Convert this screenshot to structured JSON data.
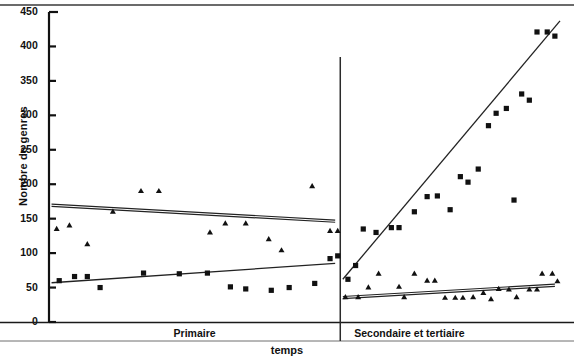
{
  "chart_data": {
    "type": "scatter",
    "title": "",
    "xlabel": "temps",
    "ylabel": "Nombre de genres",
    "ylim": [
      0,
      450
    ],
    "ytick_labels": [
      "0",
      "50",
      "100",
      "150",
      "200",
      "250",
      "300",
      "350",
      "400",
      "450"
    ],
    "ytick_values": [
      0,
      50,
      100,
      150,
      200,
      250,
      300,
      350,
      400,
      450
    ],
    "xlim": [
      0,
      100
    ],
    "grid": false,
    "legend": "none",
    "x_categories": [
      "Primaire",
      "Secondaire et tertiaire"
    ],
    "category_divider_x": 57,
    "marker_color": "#111111",
    "line_color": "#222222",
    "series": [
      {
        "name": "carres",
        "marker": "square",
        "points": [
          {
            "x": 2.0,
            "y": 60
          },
          {
            "x": 5.0,
            "y": 66
          },
          {
            "x": 7.5,
            "y": 66
          },
          {
            "x": 10.0,
            "y": 50
          },
          {
            "x": 18.5,
            "y": 71
          },
          {
            "x": 25.5,
            "y": 70
          },
          {
            "x": 31.0,
            "y": 71
          },
          {
            "x": 35.5,
            "y": 51
          },
          {
            "x": 38.5,
            "y": 48
          },
          {
            "x": 43.5,
            "y": 46
          },
          {
            "x": 47.0,
            "y": 50
          },
          {
            "x": 52.0,
            "y": 56
          },
          {
            "x": 55.0,
            "y": 92
          },
          {
            "x": 56.5,
            "y": 96
          },
          {
            "x": 58.5,
            "y": 62
          },
          {
            "x": 60.0,
            "y": 82
          },
          {
            "x": 61.5,
            "y": 135
          },
          {
            "x": 64.0,
            "y": 130
          },
          {
            "x": 67.0,
            "y": 137
          },
          {
            "x": 68.5,
            "y": 137
          },
          {
            "x": 71.5,
            "y": 160
          },
          {
            "x": 74.0,
            "y": 182
          },
          {
            "x": 76.0,
            "y": 183
          },
          {
            "x": 78.5,
            "y": 163
          },
          {
            "x": 80.5,
            "y": 211
          },
          {
            "x": 82.0,
            "y": 203
          },
          {
            "x": 84.0,
            "y": 222
          },
          {
            "x": 86.0,
            "y": 285
          },
          {
            "x": 87.5,
            "y": 303
          },
          {
            "x": 89.5,
            "y": 310
          },
          {
            "x": 91.0,
            "y": 177
          },
          {
            "x": 92.5,
            "y": 331
          },
          {
            "x": 94.0,
            "y": 322
          },
          {
            "x": 95.5,
            "y": 421
          },
          {
            "x": 97.5,
            "y": 421
          },
          {
            "x": 99.0,
            "y": 415
          }
        ],
        "trend_lines": [
          {
            "segment": "Primaire",
            "x1": 0.5,
            "y1": 57,
            "x2": 56.0,
            "y2": 85
          },
          {
            "segment": "Secondaire et tertiaire",
            "x1": 57.5,
            "y1": 62,
            "x2": 100.0,
            "y2": 437
          }
        ]
      },
      {
        "name": "triangles",
        "marker": "triangle",
        "points": [
          {
            "x": 1.5,
            "y": 135
          },
          {
            "x": 4.0,
            "y": 140
          },
          {
            "x": 7.5,
            "y": 113
          },
          {
            "x": 12.5,
            "y": 160
          },
          {
            "x": 18.0,
            "y": 190
          },
          {
            "x": 21.5,
            "y": 190
          },
          {
            "x": 31.5,
            "y": 130
          },
          {
            "x": 34.5,
            "y": 143
          },
          {
            "x": 38.5,
            "y": 143
          },
          {
            "x": 43.0,
            "y": 120
          },
          {
            "x": 45.5,
            "y": 104
          },
          {
            "x": 51.5,
            "y": 197
          },
          {
            "x": 55.0,
            "y": 132
          },
          {
            "x": 56.5,
            "y": 132
          },
          {
            "x": 58.0,
            "y": 36
          },
          {
            "x": 60.5,
            "y": 36
          },
          {
            "x": 62.5,
            "y": 50
          },
          {
            "x": 64.5,
            "y": 70
          },
          {
            "x": 68.5,
            "y": 51
          },
          {
            "x": 69.5,
            "y": 36
          },
          {
            "x": 71.5,
            "y": 70
          },
          {
            "x": 74.0,
            "y": 60
          },
          {
            "x": 75.5,
            "y": 60
          },
          {
            "x": 77.5,
            "y": 35
          },
          {
            "x": 79.5,
            "y": 35
          },
          {
            "x": 81.0,
            "y": 35
          },
          {
            "x": 83.0,
            "y": 36
          },
          {
            "x": 85.0,
            "y": 42
          },
          {
            "x": 86.5,
            "y": 33
          },
          {
            "x": 88.0,
            "y": 48
          },
          {
            "x": 90.0,
            "y": 47
          },
          {
            "x": 91.5,
            "y": 36
          },
          {
            "x": 94.0,
            "y": 47
          },
          {
            "x": 95.5,
            "y": 47
          },
          {
            "x": 96.5,
            "y": 70
          },
          {
            "x": 98.5,
            "y": 70
          },
          {
            "x": 99.5,
            "y": 59
          }
        ],
        "trend_lines": [
          {
            "segment": "Primaire",
            "x1": 0.5,
            "y1": 171,
            "x2": 56.0,
            "y2": 148
          },
          {
            "segment": "Secondaire et tertiaire",
            "x1": 57.5,
            "y1": 37,
            "x2": 99.0,
            "y2": 55
          }
        ]
      }
    ]
  }
}
